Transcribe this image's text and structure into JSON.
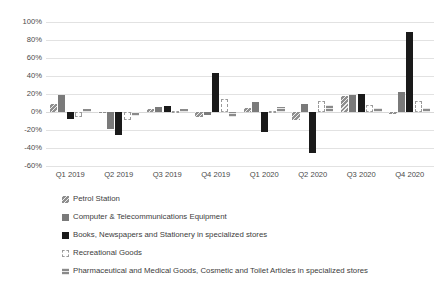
{
  "chart_data": {
    "type": "bar",
    "title": "",
    "subtitle": "",
    "xlabel": "",
    "ylabel": "",
    "ylim": [
      -60,
      100
    ],
    "ytick_values": [
      100,
      80,
      60,
      40,
      20,
      0,
      -20,
      -40,
      -60
    ],
    "ytick_labels": [
      "100%",
      "80%",
      "60%",
      "40%",
      "20%",
      "0%",
      "-20%",
      "-40%",
      "-60%"
    ],
    "grid": true,
    "legend_position": "bottom-left",
    "categories": [
      "Q1 2019",
      "Q2 2019",
      "Q3 2019",
      "Q4 2019",
      "Q1 2020",
      "Q2 2020",
      "Q3 2020",
      "Q4 2020"
    ],
    "series": [
      {
        "name": "Petrol Station",
        "color": "#8f8f8f",
        "pattern": "hatch",
        "values": [
          9,
          -1,
          3,
          -5,
          4,
          -9,
          18,
          -2
        ]
      },
      {
        "name": "Computer & Telecommunications Equipment",
        "color": "#7a7a7a",
        "pattern": "solid",
        "values": [
          19,
          -19,
          6,
          -3,
          11,
          9,
          19,
          22
        ]
      },
      {
        "name": "Books, Newspapers and Stationery in specialized stores",
        "color": "#1a1a1a",
        "pattern": "solid",
        "values": [
          -8,
          -25,
          7,
          43,
          -22,
          -45,
          20,
          89
        ]
      },
      {
        "name": "Recreational Goods",
        "color": "#ffffff",
        "pattern": "dashed-outline",
        "values": [
          -6,
          -9,
          1,
          14,
          1,
          12,
          8,
          12
        ]
      },
      {
        "name": "Pharmaceutical and Medical Goods, Cosmetic and Toilet Articles in specialized stores",
        "color": "#8a8a8a",
        "pattern": "hatch",
        "values": [
          3,
          -4,
          3,
          -6,
          6,
          8,
          5,
          4
        ]
      }
    ]
  },
  "legend": {
    "items": [
      {
        "label": "Petrol Station"
      },
      {
        "label": "Computer & Telecommunications Equipment"
      },
      {
        "label": "Books, Newspapers and Stationery in specialized stores"
      },
      {
        "label": "Recreational Goods"
      },
      {
        "label": "Pharmaceutical and Medical Goods, Cosmetic and Toilet Articles in specialized stores"
      }
    ]
  }
}
